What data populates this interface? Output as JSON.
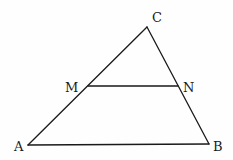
{
  "diagram": {
    "type": "geometry-triangle",
    "points": {
      "A": {
        "label": "A",
        "x": 28,
        "y": 145,
        "label_x": 14,
        "label_y": 151
      },
      "B": {
        "label": "B",
        "x": 209,
        "y": 144,
        "label_x": 213,
        "label_y": 151
      },
      "C": {
        "label": "C",
        "x": 147,
        "y": 27,
        "label_x": 152,
        "label_y": 22
      },
      "M": {
        "label": "M",
        "x": 88,
        "y": 86,
        "label_x": 65,
        "label_y": 92
      },
      "N": {
        "label": "N",
        "x": 178,
        "y": 86,
        "label_x": 183,
        "label_y": 92
      }
    },
    "segments": [
      {
        "from": "A",
        "to": "B"
      },
      {
        "from": "A",
        "to": "C"
      },
      {
        "from": "B",
        "to": "C"
      },
      {
        "from": "M",
        "to": "N"
      }
    ],
    "stroke_color": "#1a1a1a",
    "background_color": "#fefefe"
  }
}
